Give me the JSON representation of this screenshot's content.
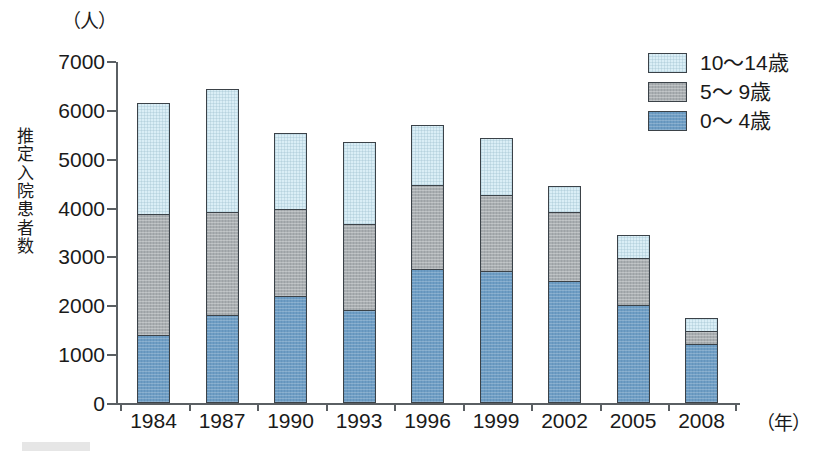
{
  "chart_data": {
    "type": "bar",
    "subtype": "stacked-vertical",
    "title": "",
    "unit_label": "（人）",
    "xlabel": "（年）",
    "ylabel": "推定入院患者数",
    "categories": [
      "1984",
      "1987",
      "1990",
      "1993",
      "1996",
      "1999",
      "2002",
      "2005",
      "2008"
    ],
    "series": [
      {
        "name": "0〜 4歳",
        "color": "#6e9dc4",
        "values": [
          1400,
          1800,
          2200,
          1900,
          2750,
          2700,
          2500,
          2000,
          1200
        ]
      },
      {
        "name": "5〜 9歳",
        "color": "#a9aeb1",
        "values": [
          2500,
          2150,
          1800,
          1800,
          1750,
          1600,
          1450,
          1000,
          300
        ]
      },
      {
        "name": "10〜14歳",
        "color": "#daeef6",
        "values": [
          2300,
          2550,
          1600,
          1700,
          1250,
          1200,
          550,
          500,
          300
        ]
      }
    ],
    "totals": [
      6200,
      6500,
      5600,
      5400,
      5750,
      5500,
      4500,
      3500,
      1800
    ],
    "ylim": [
      0,
      7000
    ],
    "yticks": [
      0,
      1000,
      2000,
      3000,
      4000,
      5000,
      6000,
      7000
    ],
    "ytick_labels": [
      "0",
      "1000",
      "2000",
      "3000",
      "4000",
      "5000",
      "6000",
      "7000"
    ],
    "grid": false,
    "legend_position": "top-right",
    "legend": [
      {
        "label": "10〜14歳",
        "color": "#daeef6"
      },
      {
        "label": "5〜 9歳",
        "color": "#a9aeb1"
      },
      {
        "label": "0〜 4歳",
        "color": "#6e9dc4"
      }
    ]
  }
}
